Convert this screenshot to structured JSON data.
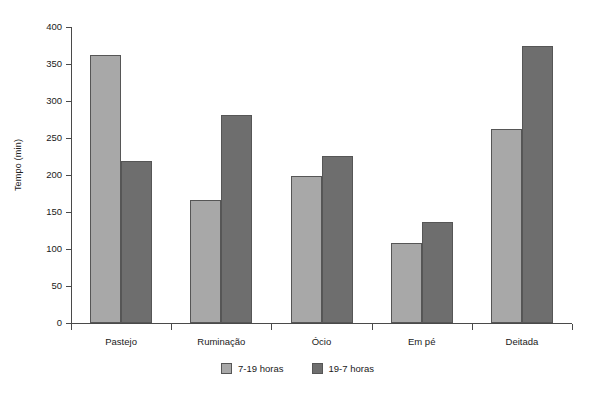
{
  "chart_data": {
    "type": "bar",
    "title": "",
    "subtitle": "",
    "xlabel": "",
    "ylabel": "Tempo (min)",
    "categories": [
      "Pastejo",
      "Ruminação",
      "Ócio",
      "Em pé",
      "Deitada"
    ],
    "series": [
      {
        "name": "7-19 horas",
        "color": "#a8a8a8",
        "values": [
          362,
          166,
          199,
          108,
          262
        ]
      },
      {
        "name": "19-7 horas",
        "color": "#6e6e6e",
        "values": [
          219,
          281,
          226,
          136,
          374
        ]
      }
    ],
    "ylim": [
      0,
      400
    ],
    "yticks": [
      0,
      50,
      100,
      150,
      200,
      250,
      300,
      350,
      400
    ],
    "ytick_labels": [
      "0",
      "50",
      "100",
      "150",
      "200",
      "250",
      "300",
      "350",
      "400"
    ],
    "grid": false,
    "legend_position": "bottom"
  },
  "legend": {
    "items": [
      {
        "label": "7-19 horas"
      },
      {
        "label": "19-7 horas"
      }
    ]
  },
  "axes": {
    "y_title": "Tempo (min)"
  }
}
